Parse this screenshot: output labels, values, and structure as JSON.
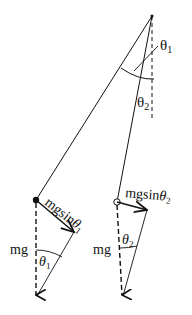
{
  "diagram": {
    "type": "pendulum-force-diagram",
    "labels": {
      "theta1_top": "θ",
      "theta1_top_sub": "1",
      "theta2_top": "θ",
      "theta2_top_sub": "2",
      "left_force_mgsin": "mgsin",
      "left_force_theta": "θ",
      "left_force_sub": "1",
      "right_force_mgsin": "mgsin",
      "right_force_theta": "θ",
      "right_force_sub": "2",
      "left_mg": "mg",
      "right_mg": "mg",
      "left_angle": "θ",
      "left_angle_sub": "1",
      "right_angle": "θ",
      "right_angle_sub": "2"
    },
    "colors": {
      "stroke": "#111111",
      "background": "#ffffff"
    }
  }
}
